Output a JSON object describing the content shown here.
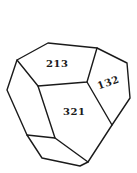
{
  "diagram": {
    "type": "crystal-face-diagram",
    "faces": [
      {
        "label": "213",
        "x": 47,
        "y": 59,
        "rotate": 0
      },
      {
        "label": "132",
        "x": 98,
        "y": 78,
        "rotate": -20
      },
      {
        "label": "321",
        "x": 64,
        "y": 107,
        "rotate": 0
      }
    ],
    "colors": {
      "line": "#1a1a1a",
      "background": "#ffffff"
    }
  }
}
